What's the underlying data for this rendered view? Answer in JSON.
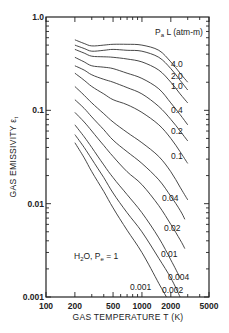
{
  "chart_data": {
    "type": "line",
    "title": "",
    "xlabel": "GAS TEMPERATURE T (K)",
    "ylabel": "GAS EMISSIVITY εt",
    "xscale": "log",
    "yscale": "log",
    "xlim": [
      100,
      5000
    ],
    "ylim": [
      0.001,
      1.0
    ],
    "x_ticks": [
      100,
      200,
      500,
      1000,
      2000,
      5000
    ],
    "x_tick_labels": [
      "100",
      "200",
      "500",
      "1000",
      "2000",
      "5000"
    ],
    "y_ticks": [
      0.001,
      0.01,
      0.1,
      1.0
    ],
    "y_tick_labels": [
      "0.001",
      "0.01",
      "0.1",
      "1.0"
    ],
    "legend_title": "PaL (atm-m)",
    "annotation": "H2O, Pe = 1",
    "grid": false,
    "series": [
      {
        "name": "4.0",
        "points": [
          [
            200,
            0.57
          ],
          [
            250,
            0.52
          ],
          [
            300,
            0.49
          ],
          [
            400,
            0.5
          ],
          [
            500,
            0.51
          ],
          [
            700,
            0.51
          ],
          [
            1000,
            0.5
          ],
          [
            1500,
            0.44
          ],
          [
            2000,
            0.33
          ],
          [
            2500,
            0.25
          ],
          [
            3000,
            0.2
          ]
        ]
      },
      {
        "name": "2.0",
        "points": [
          [
            200,
            0.5
          ],
          [
            250,
            0.46
          ],
          [
            300,
            0.43
          ],
          [
            400,
            0.44
          ],
          [
            500,
            0.45
          ],
          [
            700,
            0.44
          ],
          [
            1000,
            0.43
          ],
          [
            1500,
            0.37
          ],
          [
            2000,
            0.28
          ],
          [
            2500,
            0.21
          ],
          [
            3000,
            0.165
          ]
        ]
      },
      {
        "name": "1.0",
        "points": [
          [
            200,
            0.45
          ],
          [
            250,
            0.41
          ],
          [
            300,
            0.38
          ],
          [
            400,
            0.375
          ],
          [
            500,
            0.37
          ],
          [
            700,
            0.355
          ],
          [
            1000,
            0.33
          ],
          [
            1500,
            0.27
          ],
          [
            2000,
            0.2
          ],
          [
            2500,
            0.15
          ],
          [
            3000,
            0.12
          ]
        ]
      },
      {
        "name": "0.4",
        "points": [
          [
            200,
            0.37
          ],
          [
            250,
            0.33
          ],
          [
            300,
            0.3
          ],
          [
            400,
            0.29
          ],
          [
            500,
            0.28
          ],
          [
            700,
            0.25
          ],
          [
            1000,
            0.22
          ],
          [
            1500,
            0.17
          ],
          [
            2000,
            0.12
          ],
          [
            2500,
            0.09
          ],
          [
            3000,
            0.07
          ]
        ]
      },
      {
        "name": "0.2",
        "points": [
          [
            200,
            0.3
          ],
          [
            250,
            0.27
          ],
          [
            300,
            0.24
          ],
          [
            400,
            0.215
          ],
          [
            500,
            0.2
          ],
          [
            700,
            0.175
          ],
          [
            1000,
            0.15
          ],
          [
            1500,
            0.11
          ],
          [
            2000,
            0.08
          ],
          [
            2500,
            0.06
          ],
          [
            3000,
            0.047
          ]
        ]
      },
      {
        "name": "0.1",
        "points": [
          [
            200,
            0.25
          ],
          [
            250,
            0.21
          ],
          [
            300,
            0.18
          ],
          [
            400,
            0.15
          ],
          [
            500,
            0.13
          ],
          [
            700,
            0.115
          ],
          [
            1000,
            0.095
          ],
          [
            1500,
            0.07
          ],
          [
            2000,
            0.05
          ],
          [
            2500,
            0.036
          ],
          [
            3000,
            0.027
          ]
        ]
      },
      {
        "name": "0.04",
        "points": [
          [
            200,
            0.18
          ],
          [
            250,
            0.145
          ],
          [
            300,
            0.12
          ],
          [
            400,
            0.092
          ],
          [
            500,
            0.075
          ],
          [
            700,
            0.058
          ],
          [
            1000,
            0.045
          ],
          [
            1500,
            0.032
          ],
          [
            2000,
            0.022
          ],
          [
            2500,
            0.015
          ],
          [
            3000,
            0.011
          ]
        ]
      },
      {
        "name": "0.02",
        "points": [
          [
            200,
            0.13
          ],
          [
            250,
            0.105
          ],
          [
            300,
            0.085
          ],
          [
            400,
            0.062
          ],
          [
            500,
            0.048
          ],
          [
            700,
            0.036
          ],
          [
            1000,
            0.027
          ],
          [
            1500,
            0.018
          ],
          [
            2000,
            0.012
          ],
          [
            2500,
            0.0085
          ],
          [
            2800,
            0.0068
          ]
        ]
      },
      {
        "name": "0.01",
        "points": [
          [
            200,
            0.095
          ],
          [
            250,
            0.075
          ],
          [
            300,
            0.06
          ],
          [
            400,
            0.042
          ],
          [
            500,
            0.032
          ],
          [
            700,
            0.022
          ],
          [
            1000,
            0.016
          ],
          [
            1500,
            0.0095
          ],
          [
            2000,
            0.006
          ],
          [
            2500,
            0.0041
          ],
          [
            2800,
            0.0033
          ]
        ]
      },
      {
        "name": "0.004",
        "points": [
          [
            200,
            0.07
          ],
          [
            250,
            0.052
          ],
          [
            300,
            0.04
          ],
          [
            400,
            0.026
          ],
          [
            500,
            0.019
          ],
          [
            700,
            0.0125
          ],
          [
            1000,
            0.008
          ],
          [
            1500,
            0.0043
          ],
          [
            2000,
            0.0025
          ],
          [
            2500,
            0.0016
          ]
        ]
      },
      {
        "name": "0.002",
        "points": [
          [
            200,
            0.055
          ],
          [
            250,
            0.04
          ],
          [
            300,
            0.03
          ],
          [
            400,
            0.019
          ],
          [
            500,
            0.013
          ],
          [
            700,
            0.008
          ],
          [
            1000,
            0.005
          ],
          [
            1500,
            0.0026
          ],
          [
            2000,
            0.0016
          ],
          [
            2500,
            0.001
          ]
        ]
      },
      {
        "name": "0.001",
        "points": [
          [
            200,
            0.045
          ],
          [
            250,
            0.031
          ],
          [
            300,
            0.022
          ],
          [
            400,
            0.0135
          ],
          [
            500,
            0.009
          ],
          [
            700,
            0.0052
          ],
          [
            1000,
            0.003
          ],
          [
            1500,
            0.0014
          ],
          [
            1800,
            0.001
          ]
        ]
      }
    ],
    "label_positions": [
      {
        "text": "4.0",
        "x": 171,
        "y": 67
      },
      {
        "text": "2.0",
        "x": 171,
        "y": 79
      },
      {
        "text": "1.0",
        "x": 171,
        "y": 89
      },
      {
        "text": "0.4",
        "x": 171,
        "y": 113
      },
      {
        "text": "0.2",
        "x": 171,
        "y": 134
      },
      {
        "text": "0.1",
        "x": 171,
        "y": 159
      },
      {
        "text": "0.04",
        "x": 162,
        "y": 201
      },
      {
        "text": "0.02",
        "x": 164,
        "y": 231
      },
      {
        "text": "0.01",
        "x": 161,
        "y": 257
      },
      {
        "text": "0.004",
        "x": 168,
        "y": 280
      },
      {
        "text": "0.002",
        "x": 162,
        "y": 293
      },
      {
        "text": "0.001",
        "x": 130,
        "y": 290
      }
    ]
  }
}
